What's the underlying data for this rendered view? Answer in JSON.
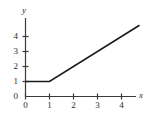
{
  "chart_data": {
    "type": "line",
    "title": "",
    "subtitle": "",
    "xlabel": "x",
    "ylabel": "y",
    "xlim": [
      0,
      5
    ],
    "ylim": [
      0,
      5.4
    ],
    "grid": false,
    "legend": null,
    "xticks": [
      "0",
      "1",
      "2",
      "3",
      "4"
    ],
    "xtick_values": [
      0,
      1,
      2,
      3,
      4
    ],
    "yticks": [
      "0",
      "1",
      "2",
      "3",
      "4"
    ],
    "ytick_values": [
      0,
      1,
      2,
      3,
      4
    ],
    "series": [
      {
        "name": "piecewise-function",
        "color": "#1a1a1a",
        "x": [
          0,
          1,
          4.75
        ],
        "y": [
          1,
          1,
          4.75
        ],
        "description": "constant 1 on [0,1], then slope 1"
      }
    ],
    "annotations": []
  },
  "axes": {
    "x_axis_label": "x",
    "y_axis_label": "y",
    "axis_color": "#3a3a3a"
  }
}
